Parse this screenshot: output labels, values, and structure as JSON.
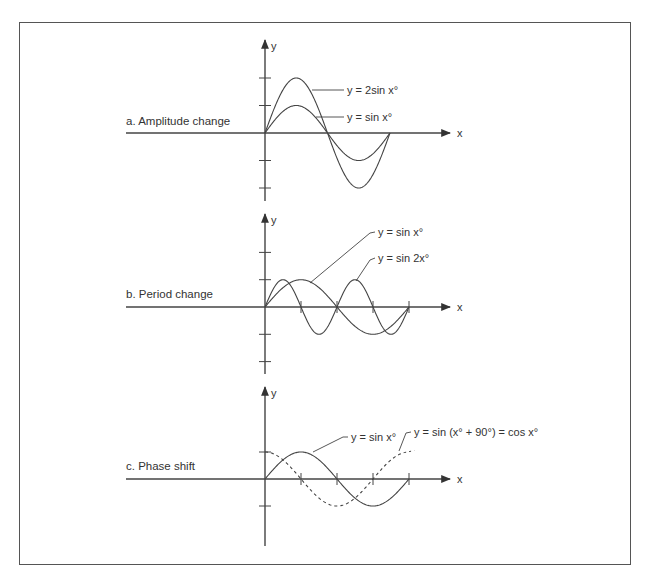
{
  "figure": {
    "panels": [
      {
        "id": "a",
        "title": "a. Amplitude change",
        "x_label": "x",
        "y_label": "y",
        "origin": [
          265,
          133
        ],
        "unit": 27.5,
        "period_px": 125,
        "y_ticks": [
          2,
          1,
          -1,
          -2
        ],
        "x_ticks": [],
        "y_top": 40,
        "y_bottom": 201,
        "curves": [
          {
            "label": "y = 2sin x°",
            "amp": 2,
            "freq": 1,
            "phase": 0,
            "dashed": false
          },
          {
            "label": "y = sin x°",
            "amp": 1,
            "freq": 1,
            "phase": 0,
            "dashed": false
          }
        ],
        "callouts": [
          {
            "text": "y = 2sin x°",
            "tx": 347,
            "ty": 94,
            "line": [
              [
                312,
                90
              ],
              [
                344,
                90
              ]
            ]
          },
          {
            "text": "y = sin x°",
            "tx": 347,
            "ty": 121,
            "line": [
              [
                316,
                117
              ],
              [
                344,
                117
              ]
            ]
          }
        ]
      },
      {
        "id": "b",
        "title": "b. Period change",
        "x_label": "x",
        "y_label": "y",
        "origin": [
          265,
          307
        ],
        "unit": 27.3,
        "period_px": 144,
        "y_ticks": [
          2,
          1,
          -1,
          -2
        ],
        "x_ticks": [
          301,
          337,
          373,
          409
        ],
        "y_top": 214,
        "y_bottom": 374,
        "curves": [
          {
            "label": "y = sin x°",
            "amp": 1,
            "freq": 1,
            "phase": 0,
            "dashed": false
          },
          {
            "label": "y = sin 2x°",
            "amp": 1,
            "freq": 2,
            "phase": 0,
            "dashed": false
          }
        ],
        "callouts": [
          {
            "text": "y = sin x°",
            "tx": 378,
            "ty": 236,
            "line": [
              [
                310,
                283
              ],
              [
                370,
                233
              ],
              [
                375,
                232
              ]
            ]
          },
          {
            "text": "y = sin 2x°",
            "tx": 378,
            "ty": 262,
            "line": [
              [
                356,
                281
              ],
              [
                370,
                260
              ],
              [
                375,
                258
              ]
            ]
          }
        ]
      },
      {
        "id": "c",
        "title": "c. Phase shift",
        "x_label": "x",
        "y_label": "y",
        "origin": [
          265,
          479
        ],
        "unit": 27,
        "period_px": 144,
        "y_ticks": [
          1,
          -1
        ],
        "x_ticks": [
          301,
          337,
          373,
          409
        ],
        "y_top": 387,
        "y_bottom": 546,
        "curves": [
          {
            "label": "y = sin x°",
            "amp": 1,
            "freq": 1,
            "phase": 0,
            "dashed": false
          },
          {
            "label": "y = sin (x° + 90°) = cos x°",
            "amp": 1,
            "freq": 1,
            "phase": 90,
            "dashed": true,
            "x_end_deg": 348
          }
        ],
        "callouts": [
          {
            "text": "y = sin x°",
            "tx": 351,
            "ty": 441,
            "line": [
              [
                313,
                452
              ],
              [
                343,
                437
              ],
              [
                348,
                437
              ]
            ]
          },
          {
            "text": "y = sin (x° + 90°) = cos x°",
            "tx": 414,
            "ty": 436,
            "line": [
              [
                399,
                451
              ],
              [
                406,
                433
              ],
              [
                411,
                432
              ]
            ]
          }
        ]
      }
    ],
    "axis_x_start": 126,
    "axis_x_end": 450,
    "colors": {
      "ink": "#444444",
      "frame": "#555555"
    }
  }
}
